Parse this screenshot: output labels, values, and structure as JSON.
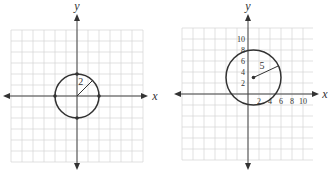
{
  "chart_data": [
    {
      "type": "line",
      "title": "",
      "xlabel": "x",
      "ylabel": "y",
      "xlim": [
        -6,
        6
      ],
      "ylim": [
        -6,
        6
      ],
      "grid": true,
      "unit_per_cell": 1,
      "tick_labels_x": [],
      "tick_labels_y": [],
      "circle": {
        "center": [
          0,
          0
        ],
        "radius": 2,
        "radius_label": "2",
        "radius_angle_deg": 45
      },
      "marked_points": [
        [
          2,
          0
        ],
        [
          -2,
          0
        ],
        [
          0,
          2
        ],
        [
          0,
          -2
        ]
      ]
    },
    {
      "type": "line",
      "title": "",
      "xlabel": "x",
      "ylabel": "y",
      "xlim": [
        -12,
        12
      ],
      "ylim": [
        -12,
        12
      ],
      "grid": true,
      "unit_per_cell": 2,
      "tick_labels_x": [
        "2",
        "4",
        "6",
        "8",
        "10"
      ],
      "tick_values_x": [
        2,
        4,
        6,
        8,
        10
      ],
      "tick_labels_y": [
        "2",
        "4",
        "6",
        "8",
        "10"
      ],
      "tick_values_y": [
        2,
        4,
        6,
        8,
        10
      ],
      "circle": {
        "center": [
          1,
          3
        ],
        "radius": 5,
        "radius_label": "5",
        "radius_angle_deg": 25
      },
      "marked_points": [
        [
          1,
          3
        ]
      ]
    }
  ]
}
